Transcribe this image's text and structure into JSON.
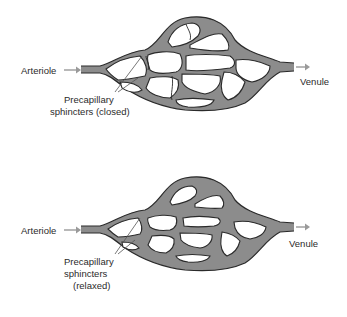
{
  "diagram": {
    "type": "capillary bed comparison",
    "colors": {
      "vessel": "#8c8c8c",
      "outline": "#2a2a2a",
      "arrow": "#9a9a9a",
      "text": "#2b2b2b",
      "background": "#ffffff"
    },
    "panels": [
      {
        "state": "closed",
        "inflow_label": "Arteriole",
        "outflow_label": "Venule",
        "sphincter_label_line1": "Precapillary",
        "sphincter_label_line2": "sphincters (closed)"
      },
      {
        "state": "relaxed",
        "inflow_label": "Arteriole",
        "outflow_label": "Venule",
        "sphincter_label_line1": "Precapillary",
        "sphincter_label_line2": "sphincters",
        "sphincter_label_line3": "(relaxed)"
      }
    ]
  }
}
